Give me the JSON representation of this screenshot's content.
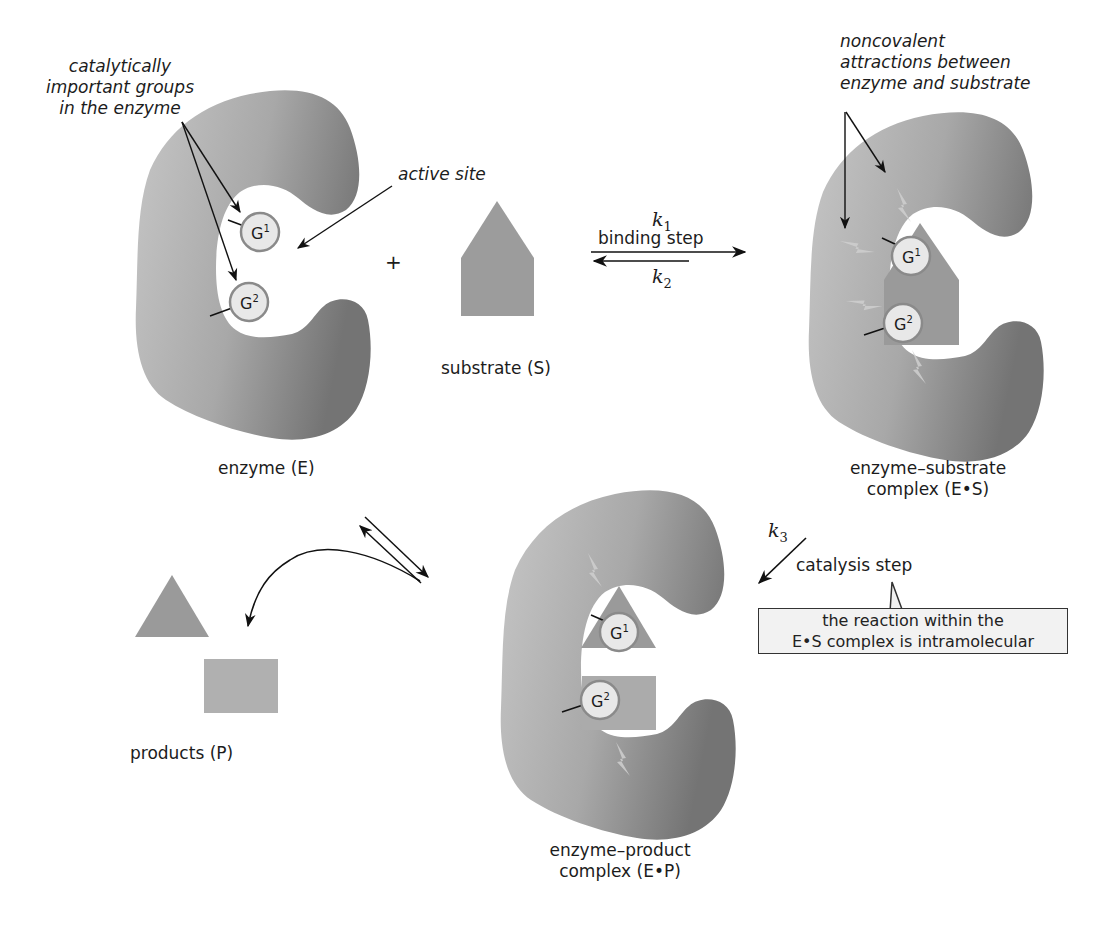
{
  "figure": {
    "colors": {
      "enzyme_light": "#c2c2c2",
      "enzyme_dark": "#7c7c7c",
      "substrate": "#9a9a9a",
      "product_square": "#b0b0b0",
      "g_circle_fill": "#e8e8e8",
      "g_circle_stroke": "#8a8a8a",
      "callout_bg": "#f2f2f2",
      "lightning": "#c8c8c8"
    }
  },
  "labels": {
    "catalytic_groups": [
      "catalytically",
      "important groups",
      "in the enzyme"
    ],
    "active_site": "active site",
    "noncovalent": [
      "noncovalent",
      "attractions between",
      "enzyme and substrate"
    ],
    "enzyme": "enzyme (E)",
    "substrate": "substrate (S)",
    "plus": "+",
    "es_complex": [
      "enzyme–substrate",
      "complex (E•S)"
    ],
    "ep_complex": [
      "enzyme–product",
      "complex (E•P)"
    ],
    "products": "products (P)"
  },
  "groups": {
    "g1": {
      "letter": "G",
      "sup": "1"
    },
    "g2": {
      "letter": "G",
      "sup": "2"
    }
  },
  "steps": {
    "binding": {
      "label": "binding step",
      "k_forward": "k",
      "k_forward_sub": "1",
      "k_reverse": "k",
      "k_reverse_sub": "2"
    },
    "catalysis": {
      "label": "catalysis step",
      "k": "k",
      "k_sub": "3"
    },
    "callout": [
      "the reaction within the",
      "E•S complex is intramolecular"
    ]
  }
}
